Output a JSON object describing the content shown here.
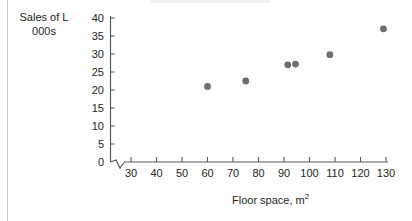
{
  "chart_data": {
    "type": "scatter",
    "title": "",
    "xlabel": "Floor space, m2",
    "xlabel_base": "Floor space, m",
    "xlabel_sup": "2",
    "ylabel": "Sales of L 000s",
    "ylabel_line1": "Sales of L",
    "ylabel_line2": "000s",
    "xlim": [
      25,
      133
    ],
    "ylim": [
      0,
      40
    ],
    "x_ticks": [
      30,
      40,
      50,
      60,
      70,
      80,
      90,
      100,
      110,
      120,
      130
    ],
    "y_ticks": [
      0,
      5,
      10,
      15,
      20,
      25,
      30,
      35,
      40
    ],
    "grid": false,
    "legend": false,
    "axis_break_x": true,
    "marker_color": "#6d6e71",
    "axis_color": "#58595b",
    "text_color": "#231f20",
    "points": [
      {
        "x": 60,
        "y": 21.0
      },
      {
        "x": 75,
        "y": 22.5
      },
      {
        "x": 91.5,
        "y": 27.0
      },
      {
        "x": 94.5,
        "y": 27.2
      },
      {
        "x": 108,
        "y": 29.8
      },
      {
        "x": 129,
        "y": 37.0
      }
    ]
  },
  "y_axis": {
    "labels": [
      "40",
      "35",
      "30",
      "25",
      "20",
      "15",
      "10",
      "5",
      "0"
    ]
  },
  "x_axis": {
    "labels": [
      "30",
      "40",
      "50",
      "60",
      "70",
      "80",
      "90",
      "100",
      "110",
      "120",
      "130"
    ]
  }
}
